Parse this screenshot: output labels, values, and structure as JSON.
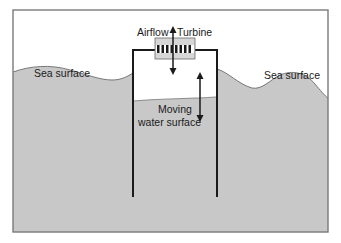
{
  "diagram": {
    "labels": {
      "airflow": "Airflow",
      "turbine": "Turbine",
      "sea_surface_left": "Sea surface",
      "sea_surface_right": "Sea surface",
      "moving_water_line1": "Moving",
      "moving_water_line2": "water surface"
    },
    "colors": {
      "water": "#c8c8c8",
      "frame": "#7a7a7a",
      "walls": "#1a1a1a",
      "turbine_box": "#d6d6d6",
      "background": "#ffffff"
    }
  }
}
